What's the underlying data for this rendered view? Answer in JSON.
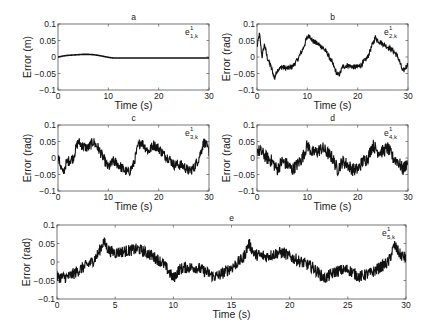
{
  "chart_data": [
    {
      "id": "a",
      "type": "line",
      "title": "a",
      "legend": {
        "base": "e",
        "sup": "1",
        "sub": "1,k"
      },
      "xlabel": "Time (s)",
      "ylabel": "Error (m)",
      "xlim": [
        0,
        30
      ],
      "ylim": [
        -0.1,
        0.1
      ],
      "xticks": [
        "0",
        "10",
        "20",
        "30"
      ],
      "yticks": [
        "-0.1",
        "-0.05",
        "0",
        "0.05",
        "0.1"
      ],
      "box": {
        "x": 58,
        "y": 24,
        "w": 151,
        "h": 66
      },
      "noise": 0.0,
      "x": [
        0,
        1,
        2,
        3,
        4,
        5,
        6,
        7,
        8,
        9,
        10,
        11,
        12,
        14,
        16,
        18,
        20,
        22,
        24,
        26,
        28,
        30
      ],
      "values": [
        0.0,
        0.003,
        0.005,
        0.006,
        0.007,
        0.008,
        0.008,
        0.007,
        0.005,
        0.002,
        -0.001,
        -0.003,
        -0.003,
        -0.003,
        -0.003,
        -0.003,
        -0.003,
        -0.003,
        -0.003,
        -0.003,
        -0.003,
        -0.003
      ]
    },
    {
      "id": "b",
      "type": "line",
      "title": "b",
      "legend": {
        "base": "e",
        "sup": "1",
        "sub": "2,k"
      },
      "xlabel": "Time (s)",
      "ylabel": "Error (rad)",
      "xlim": [
        0,
        30
      ],
      "ylim": [
        -0.1,
        0.1
      ],
      "xticks": [
        "0",
        "10",
        "20",
        "30"
      ],
      "yticks": [
        "-0.1",
        "-0.05",
        "0",
        "0.05",
        "0.1"
      ],
      "box": {
        "x": 257,
        "y": 24,
        "w": 151,
        "h": 66
      },
      "noise": 0.008,
      "x": [
        0,
        0.5,
        1,
        1.5,
        2,
        2.5,
        3,
        3.5,
        4,
        5,
        6,
        7,
        8,
        9,
        10,
        10.5,
        11,
        12,
        13,
        14,
        15,
        16,
        16.5,
        17,
        18,
        19,
        20,
        21,
        22,
        23,
        23.5,
        24,
        25,
        26,
        27,
        28,
        29,
        30
      ],
      "values": [
        0.03,
        0.07,
        0.0,
        0.04,
        0.0,
        -0.02,
        -0.04,
        -0.065,
        -0.04,
        -0.03,
        -0.035,
        -0.03,
        -0.01,
        0.02,
        0.06,
        0.065,
        0.05,
        0.04,
        0.03,
        0.01,
        -0.02,
        -0.055,
        -0.05,
        -0.03,
        -0.025,
        -0.03,
        -0.03,
        -0.02,
        0.0,
        0.04,
        0.06,
        0.05,
        0.04,
        0.03,
        0.02,
        0.0,
        -0.045,
        -0.02
      ]
    },
    {
      "id": "c",
      "type": "line",
      "title": "c",
      "legend": {
        "base": "e",
        "sup": "1",
        "sub": "3,k"
      },
      "xlabel": "Time (s)",
      "ylabel": "Error (rad)",
      "xlim": [
        0,
        30
      ],
      "ylim": [
        -0.1,
        0.1
      ],
      "xticks": [
        "0",
        "10",
        "20",
        "30"
      ],
      "yticks": [
        "-0.1",
        "-0.05",
        "0",
        "0.05",
        "0.1"
      ],
      "box": {
        "x": 58,
        "y": 125,
        "w": 151,
        "h": 66
      },
      "noise": 0.016,
      "x": [
        0,
        0.5,
        1,
        1.5,
        2,
        3,
        4,
        5,
        6,
        7,
        8,
        9,
        10,
        11,
        12,
        13,
        14,
        15,
        16,
        16.5,
        17,
        18,
        19,
        20,
        21,
        22,
        23,
        24,
        25,
        26,
        27,
        28,
        29,
        30
      ],
      "values": [
        0.0,
        -0.02,
        -0.05,
        -0.02,
        -0.01,
        0.0,
        0.05,
        0.035,
        0.03,
        0.05,
        0.03,
        0.0,
        -0.03,
        -0.01,
        -0.02,
        -0.035,
        -0.045,
        -0.02,
        0.04,
        0.05,
        0.04,
        0.02,
        0.04,
        0.03,
        0.01,
        0.0,
        -0.02,
        -0.02,
        -0.025,
        -0.04,
        -0.03,
        0.0,
        0.05,
        0.02
      ]
    },
    {
      "id": "d",
      "type": "line",
      "title": "d",
      "legend": {
        "base": "e",
        "sup": "1",
        "sub": "4,k"
      },
      "xlabel": "Time (s)",
      "ylabel": "Error (rad)",
      "xlim": [
        0,
        30
      ],
      "ylim": [
        -0.1,
        0.1
      ],
      "xticks": [
        "0",
        "10",
        "20",
        "30"
      ],
      "yticks": [
        "-0.1",
        "-0.05",
        "0",
        "0.05",
        "0.1"
      ],
      "box": {
        "x": 257,
        "y": 125,
        "w": 151,
        "h": 66
      },
      "noise": 0.02,
      "x": [
        0,
        1,
        2,
        3,
        4,
        5,
        6,
        7,
        8,
        9,
        10,
        11,
        12,
        13,
        14,
        15,
        16,
        17,
        18,
        19,
        20,
        21,
        22,
        23,
        24,
        25,
        26,
        27,
        28,
        29,
        30
      ],
      "values": [
        0.025,
        0.015,
        0.0,
        -0.01,
        -0.035,
        -0.01,
        -0.02,
        -0.035,
        -0.02,
        0.0,
        0.04,
        0.015,
        0.02,
        0.03,
        0.015,
        0.0,
        -0.035,
        -0.01,
        -0.02,
        -0.035,
        -0.035,
        -0.01,
        0.0,
        0.04,
        0.02,
        0.02,
        0.03,
        0.0,
        -0.01,
        -0.035,
        -0.01
      ]
    },
    {
      "id": "e",
      "type": "line",
      "title": "e",
      "legend": {
        "base": "e",
        "sup": "1",
        "sub": "5,k"
      },
      "xlabel": "Time (s)",
      "ylabel": "Error (rad)",
      "xlim": [
        0,
        30
      ],
      "ylim": [
        -0.1,
        0.1
      ],
      "xticks": [
        "0",
        "5",
        "10",
        "15",
        "20",
        "25",
        "30"
      ],
      "yticks": [
        "-0.1",
        "-0.05",
        "0",
        "0.05",
        "0.1"
      ],
      "box": {
        "x": 57,
        "y": 225,
        "w": 349,
        "h": 74
      },
      "noise": 0.016,
      "x": [
        0,
        0.5,
        1,
        1.5,
        2,
        2.5,
        3,
        3.5,
        4,
        4.5,
        5,
        6,
        7,
        8,
        9,
        9.5,
        10,
        10.5,
        11,
        12,
        13,
        13.5,
        14,
        15,
        16,
        16.5,
        17,
        18,
        19,
        19.5,
        20,
        21,
        22,
        22.5,
        23,
        24,
        25,
        26,
        27,
        28,
        28.5,
        29,
        29.5,
        30
      ],
      "values": [
        -0.04,
        -0.042,
        -0.04,
        -0.03,
        -0.02,
        -0.01,
        0.0,
        0.02,
        0.055,
        0.03,
        0.025,
        0.03,
        0.035,
        0.02,
        0.0,
        -0.02,
        -0.045,
        -0.02,
        -0.015,
        -0.015,
        -0.03,
        -0.04,
        -0.035,
        -0.015,
        0.01,
        0.05,
        0.02,
        0.015,
        0.025,
        0.025,
        0.015,
        0.0,
        -0.015,
        -0.03,
        -0.045,
        -0.025,
        -0.02,
        -0.04,
        -0.03,
        -0.01,
        0.0,
        0.045,
        0.02,
        0.01
      ]
    }
  ]
}
